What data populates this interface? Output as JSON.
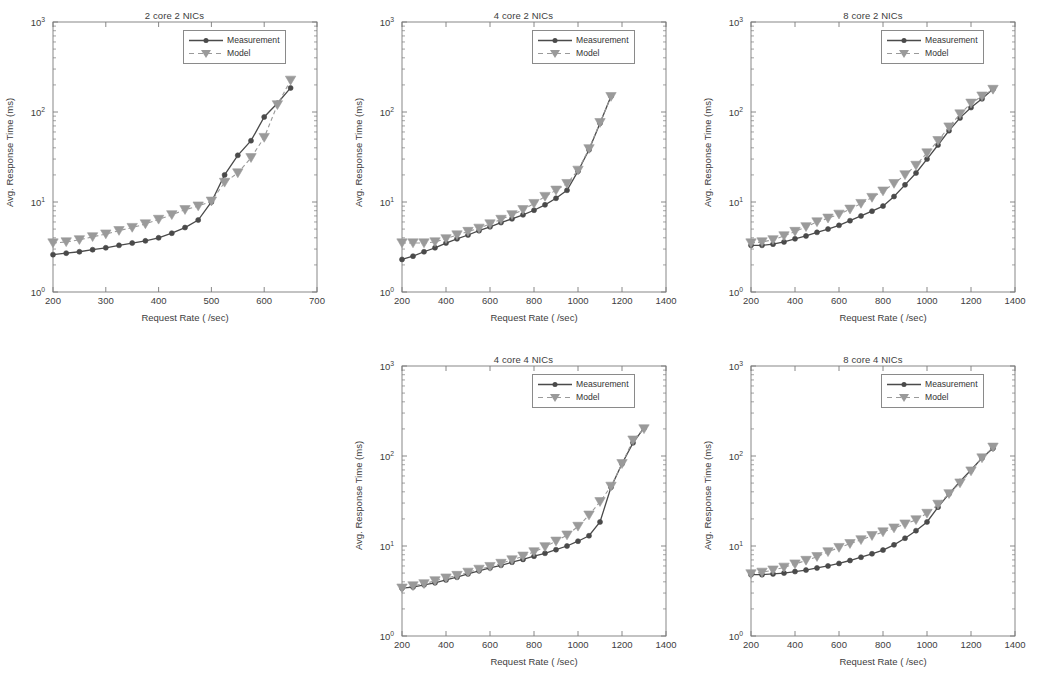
{
  "figure": {
    "axis_labels": {
      "x": "Request Rate ( /sec)",
      "y": "Avg. Response Time (ms)"
    },
    "legend": {
      "measurement": "Measurement",
      "model": "Model"
    },
    "ytick_labels": [
      "10^0",
      "10^1",
      "10^2",
      "10^3"
    ],
    "ytick_html": [
      "10<tspan baseline-shift=\"super\" font-size=\"6.5\">0</tspan>",
      "10<tspan baseline-shift=\"super\" font-size=\"6.5\">1</tspan>",
      "10<tspan baseline-shift=\"super\" font-size=\"6.5\">2</tspan>",
      "10<tspan baseline-shift=\"super\" font-size=\"6.5\">3</tspan>"
    ],
    "colors": {
      "measurement": "#4a4a4a",
      "model": "#9a9a9a",
      "axis": "#7b7b7b",
      "text": "#3d3d3d",
      "background": "#ffffff"
    }
  },
  "chart_data": [
    {
      "id": "chart-2core-2nics",
      "type": "line",
      "title": "2 core 2 NICs",
      "xlabel": "Request Rate ( /sec)",
      "ylabel": "Avg. Response Time (ms)",
      "yscale": "log",
      "ylim": [
        1,
        1000
      ],
      "yticks": [
        1,
        10,
        100,
        1000
      ],
      "xlim": [
        200,
        700
      ],
      "xticks": [
        200,
        300,
        400,
        500,
        600,
        700
      ],
      "grid": false,
      "legend_position": "top-right",
      "series": [
        {
          "name": "Measurement",
          "marker": "circle",
          "linestyle": "solid",
          "x": [
            200,
            225,
            250,
            275,
            300,
            325,
            350,
            375,
            400,
            425,
            450,
            475,
            500,
            525,
            550,
            575,
            600,
            625,
            650
          ],
          "y": [
            2.6,
            2.7,
            2.8,
            2.95,
            3.1,
            3.3,
            3.5,
            3.7,
            4.0,
            4.5,
            5.2,
            6.3,
            10.0,
            20.0,
            33.0,
            48.0,
            88.0,
            125.0,
            185.0
          ]
        },
        {
          "name": "Model",
          "marker": "triangle-down",
          "linestyle": "dashed",
          "x": [
            200,
            225,
            250,
            275,
            300,
            325,
            350,
            375,
            400,
            425,
            450,
            475,
            500,
            525,
            550,
            575,
            600,
            625,
            650
          ],
          "y": [
            3.5,
            3.6,
            3.8,
            4.1,
            4.4,
            4.8,
            5.2,
            5.7,
            6.4,
            7.2,
            8.2,
            9.0,
            10.2,
            16.5,
            21.0,
            31.0,
            52.0,
            120.0,
            225.0
          ]
        }
      ]
    },
    {
      "id": "chart-4core-2nics",
      "type": "line",
      "title": "4 core 2 NICs",
      "xlabel": "Request Rate ( /sec)",
      "ylabel": "Avg. Response Time (ms)",
      "yscale": "log",
      "ylim": [
        1,
        1000
      ],
      "yticks": [
        1,
        10,
        100,
        1000
      ],
      "xlim": [
        200,
        1400
      ],
      "xticks": [
        200,
        400,
        600,
        800,
        1000,
        1200,
        1400
      ],
      "grid": false,
      "legend_position": "top-right",
      "series": [
        {
          "name": "Measurement",
          "marker": "circle",
          "linestyle": "solid",
          "x": [
            200,
            250,
            300,
            350,
            400,
            450,
            500,
            550,
            600,
            650,
            700,
            750,
            800,
            850,
            900,
            950,
            1000,
            1050,
            1100,
            1150
          ],
          "y": [
            2.3,
            2.5,
            2.8,
            3.1,
            3.5,
            3.9,
            4.3,
            4.8,
            5.3,
            5.9,
            6.5,
            7.2,
            8.1,
            9.3,
            11.0,
            13.5,
            22.0,
            38.0,
            75.0,
            150.0
          ]
        },
        {
          "name": "Model",
          "marker": "triangle-down",
          "linestyle": "dashed",
          "x": [
            200,
            250,
            300,
            350,
            400,
            450,
            500,
            550,
            600,
            650,
            700,
            750,
            800,
            850,
            900,
            950,
            1000,
            1050,
            1100,
            1150
          ],
          "y": [
            3.5,
            3.5,
            3.5,
            3.6,
            3.9,
            4.3,
            4.7,
            5.1,
            5.7,
            6.4,
            7.2,
            8.2,
            9.6,
            11.5,
            13.5,
            16.0,
            22.5,
            39.0,
            76.0,
            148.0
          ]
        }
      ]
    },
    {
      "id": "chart-8core-2nics",
      "type": "line",
      "title": "8 core 2 NICs",
      "xlabel": "Request Rate ( /sec)",
      "ylabel": "Avg. Response Time (ms)",
      "yscale": "log",
      "ylim": [
        1,
        1000
      ],
      "yticks": [
        1,
        10,
        100,
        1000
      ],
      "xlim": [
        200,
        1400
      ],
      "xticks": [
        200,
        400,
        600,
        800,
        1000,
        1200,
        1400
      ],
      "grid": false,
      "legend_position": "top-right",
      "series": [
        {
          "name": "Measurement",
          "marker": "circle",
          "linestyle": "solid",
          "x": [
            200,
            250,
            300,
            350,
            400,
            450,
            500,
            550,
            600,
            650,
            700,
            750,
            800,
            850,
            900,
            950,
            1000,
            1050,
            1100,
            1150,
            1200,
            1250,
            1300
          ],
          "y": [
            3.3,
            3.3,
            3.4,
            3.6,
            3.9,
            4.2,
            4.6,
            5.0,
            5.5,
            6.2,
            7.0,
            7.9,
            9.0,
            11.5,
            15.5,
            21.0,
            30.0,
            43.0,
            62.0,
            86.0,
            112.0,
            140.0,
            180.0
          ]
        },
        {
          "name": "Model",
          "marker": "triangle-down",
          "linestyle": "dashed",
          "x": [
            200,
            250,
            300,
            350,
            400,
            450,
            500,
            550,
            600,
            650,
            700,
            750,
            800,
            850,
            900,
            950,
            1000,
            1050,
            1100,
            1150,
            1200,
            1250,
            1300
          ],
          "y": [
            3.5,
            3.6,
            3.8,
            4.2,
            4.7,
            5.3,
            6.0,
            6.6,
            7.3,
            8.3,
            9.6,
            11.2,
            13.2,
            16.0,
            20.0,
            25.5,
            35.0,
            48.0,
            68.0,
            95.0,
            125.0,
            150.0,
            178.0
          ]
        }
      ]
    },
    {
      "id": "chart-4core-4nics",
      "type": "line",
      "title": "4 core 4 NICs",
      "xlabel": "Request Rate ( /sec)",
      "ylabel": "Avg. Response Time (ms)",
      "yscale": "log",
      "ylim": [
        1,
        1000
      ],
      "yticks": [
        1,
        10,
        100,
        1000
      ],
      "xlim": [
        200,
        1400
      ],
      "xticks": [
        200,
        400,
        600,
        800,
        1000,
        1200,
        1400
      ],
      "grid": false,
      "legend_position": "top-right",
      "series": [
        {
          "name": "Measurement",
          "marker": "circle",
          "linestyle": "solid",
          "x": [
            200,
            250,
            300,
            350,
            400,
            450,
            500,
            550,
            600,
            650,
            700,
            750,
            800,
            850,
            900,
            950,
            1000,
            1050,
            1100,
            1150,
            1200,
            1250,
            1300
          ],
          "y": [
            3.4,
            3.5,
            3.7,
            3.9,
            4.2,
            4.5,
            4.9,
            5.3,
            5.7,
            6.1,
            6.6,
            7.1,
            7.7,
            8.3,
            9.1,
            10.0,
            11.3,
            13.0,
            18.5,
            45.0,
            82.0,
            140.0,
            205.0
          ]
        },
        {
          "name": "Model",
          "marker": "triangle-down",
          "linestyle": "dashed",
          "x": [
            200,
            250,
            300,
            350,
            400,
            450,
            500,
            550,
            600,
            650,
            700,
            750,
            800,
            850,
            900,
            950,
            1000,
            1050,
            1100,
            1150,
            1200,
            1250,
            1300
          ],
          "y": [
            3.4,
            3.6,
            3.8,
            4.1,
            4.4,
            4.7,
            5.1,
            5.5,
            5.9,
            6.4,
            7.0,
            7.7,
            8.6,
            9.8,
            11.3,
            13.2,
            16.5,
            22.0,
            31.0,
            46.0,
            82.0,
            150.0,
            200.0
          ]
        }
      ]
    },
    {
      "id": "chart-8core-4nics",
      "type": "line",
      "title": "8 core 4 NICs",
      "xlabel": "Request Rate ( /sec)",
      "ylabel": "Avg. Response Time (ms)",
      "yscale": "log",
      "ylim": [
        1,
        1000
      ],
      "yticks": [
        1,
        10,
        100,
        1000
      ],
      "xlim": [
        200,
        1400
      ],
      "xticks": [
        200,
        400,
        600,
        800,
        1000,
        1200,
        1400
      ],
      "grid": false,
      "legend_position": "top-right",
      "series": [
        {
          "name": "Measurement",
          "marker": "circle",
          "linestyle": "solid",
          "x": [
            200,
            250,
            300,
            350,
            400,
            450,
            500,
            550,
            600,
            650,
            700,
            750,
            800,
            850,
            900,
            950,
            1000,
            1050,
            1100,
            1150,
            1200,
            1250,
            1300
          ],
          "y": [
            4.8,
            4.8,
            4.9,
            5.0,
            5.2,
            5.4,
            5.7,
            6.0,
            6.4,
            6.9,
            7.5,
            8.2,
            9.0,
            10.3,
            12.2,
            14.8,
            18.5,
            27.0,
            38.0,
            52.0,
            70.0,
            95.0,
            122.0
          ]
        },
        {
          "name": "Model",
          "marker": "triangle-down",
          "linestyle": "dashed",
          "x": [
            200,
            250,
            300,
            350,
            400,
            450,
            500,
            550,
            600,
            650,
            700,
            750,
            800,
            850,
            900,
            950,
            1000,
            1050,
            1100,
            1150,
            1200,
            1250,
            1300
          ],
          "y": [
            4.9,
            5.1,
            5.4,
            5.8,
            6.3,
            6.9,
            7.6,
            8.6,
            9.6,
            10.6,
            11.7,
            13.0,
            14.3,
            15.8,
            17.5,
            19.5,
            23.0,
            29.0,
            38.0,
            50.0,
            68.0,
            95.0,
            125.0
          ]
        }
      ]
    }
  ]
}
